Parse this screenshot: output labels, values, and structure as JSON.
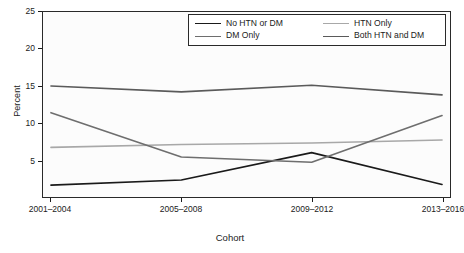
{
  "chart_data": {
    "type": "line",
    "title": "",
    "xlabel": "Cohort",
    "ylabel": "Percent",
    "categories": [
      "2001–2004",
      "2005–2008",
      "2009–2012",
      "2013–2016"
    ],
    "ylim": [
      0,
      25
    ],
    "yticks": [
      5,
      10,
      15,
      20,
      25
    ],
    "grid": false,
    "legend_position": "top-right",
    "series": [
      {
        "name": "No HTN or DM",
        "color": "#1a1a1a",
        "values": [
          1.6,
          2.3,
          6.0,
          1.7
        ]
      },
      {
        "name": "HTN Only",
        "color": "#a8a8a8",
        "values": [
          6.7,
          7.1,
          7.3,
          7.7
        ]
      },
      {
        "name": "DM Only",
        "color": "#6e6e6e",
        "values": [
          11.4,
          5.4,
          4.7,
          11.0
        ]
      },
      {
        "name": "Both HTN and DM",
        "color": "#5a5a5a",
        "values": [
          15.0,
          14.2,
          15.1,
          13.8
        ]
      }
    ]
  },
  "legend": {
    "entries": [
      {
        "label": "No HTN or DM"
      },
      {
        "label": "HTN Only"
      },
      {
        "label": "DM Only"
      },
      {
        "label": "Both HTN and DM"
      }
    ]
  },
  "axes": {
    "y_title": "Percent",
    "x_title": "Cohort",
    "y_tick_labels": [
      "5",
      "10",
      "15",
      "20",
      "25"
    ],
    "x_tick_labels": [
      "2001–2004",
      "2005–2008",
      "2009–2012",
      "2013–2016"
    ]
  }
}
